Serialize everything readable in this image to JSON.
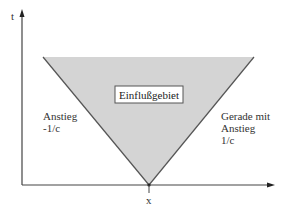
{
  "diagram": {
    "axis_t_label": "t",
    "axis_x_label": "x",
    "region_label": "Einflußgebiet",
    "left_edge_label": [
      "Anstieg",
      "-1/c"
    ],
    "right_edge_label": [
      "Gerade mit",
      "Anstieg",
      "1/c"
    ],
    "colors": {
      "region_fill": "#d4d4d4",
      "edge_stroke": "#555555",
      "axis_stroke": "#444444",
      "box_fill": "#ffffff"
    }
  }
}
